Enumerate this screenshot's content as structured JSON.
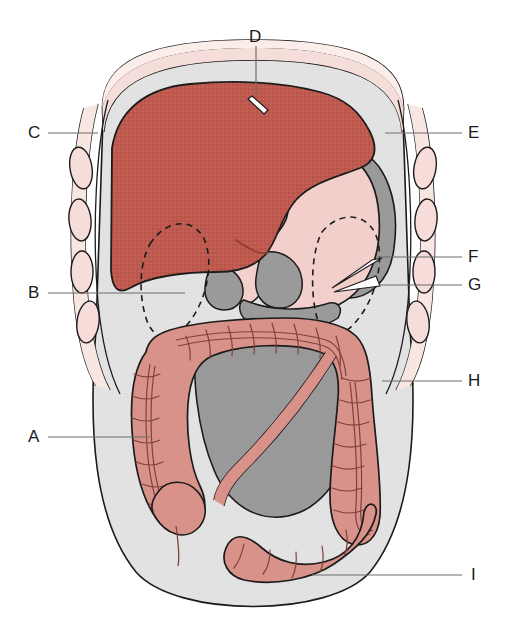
{
  "figure": {
    "view": "anterior abdominal cavity with labeled leader lines",
    "background_color": "#ffffff"
  },
  "colors": {
    "liver": "#C0594D",
    "liver_shade": "#A94A40",
    "stomach": "#F3D0CB",
    "colon": "#D99289",
    "colon_shade": "#C97F76",
    "dark_gray_organ": "#9A9A9A",
    "body_cavity": "#E3E3E3",
    "rib_fill": "#F7DDD9",
    "rib_band": "#F6E3DE",
    "outline": "#1b1b1b",
    "leader_line": "#6d6d6d",
    "label_text": "#1a1a1a"
  },
  "labels": [
    {
      "id": "A",
      "text": "A",
      "x": 33,
      "y": 437,
      "side": "left",
      "line_from_x": 48,
      "line_to_x": 150,
      "line_y": 437
    },
    {
      "id": "B",
      "text": "B",
      "x": 33,
      "y": 293,
      "side": "left",
      "line_from_x": 48,
      "line_to_x": 185,
      "line_y": 293
    },
    {
      "id": "C",
      "text": "C",
      "x": 33,
      "y": 133,
      "side": "left",
      "line_from_x": 48,
      "line_to_x": 98,
      "line_y": 133
    },
    {
      "id": "D",
      "text": "D",
      "x": 249,
      "y": 38,
      "side": "top",
      "line_from_y": 46,
      "line_to_y": 96,
      "line_x": 256
    },
    {
      "id": "E",
      "text": "E",
      "x": 468,
      "y": 133,
      "side": "right",
      "line_from_x": 385,
      "line_to_x": 462,
      "line_y": 133
    },
    {
      "id": "F",
      "text": "F",
      "x": 468,
      "y": 253,
      "side": "right",
      "line_from_x": 378,
      "line_to_x": 462,
      "line_y": 257
    },
    {
      "id": "G",
      "text": "G",
      "x": 468,
      "y": 281,
      "side": "right",
      "line_from_x": 378,
      "line_to_x": 462,
      "line_y": 285
    },
    {
      "id": "H",
      "text": "H",
      "x": 468,
      "y": 375,
      "side": "right",
      "line_from_x": 382,
      "line_to_x": 462,
      "line_y": 381
    },
    {
      "id": "I",
      "text": "I",
      "x": 470,
      "y": 569,
      "side": "right",
      "line_from_x": 312,
      "line_to_x": 462,
      "line_y": 575
    }
  ],
  "organs": [
    {
      "name": "liver",
      "color_key": "liver",
      "description": "large brick-red organ occupying upper-left of cavity"
    },
    {
      "name": "stomach",
      "color_key": "stomach",
      "description": "pale pink J-shaped organ right of liver"
    },
    {
      "name": "spleen",
      "color_key": "dark_gray_organ",
      "description": "dark gray crescent at upper right"
    },
    {
      "name": "large-intestine",
      "color_key": "colon",
      "description": "dusty rose haustrated colon framing lower cavity"
    },
    {
      "name": "small-intestine",
      "color_key": "dark_gray_organ",
      "description": "dark gray coiled mass in central lower cavity"
    },
    {
      "name": "kidney-left",
      "color_key": "outline",
      "description": "dashed bean outline, left upper quadrant"
    },
    {
      "name": "kidney-right",
      "color_key": "outline",
      "description": "dashed bean outline, right upper quadrant"
    },
    {
      "name": "rib-cage",
      "color_key": "rib_fill",
      "description": "pale pink oval ribs flanking both sides"
    },
    {
      "name": "body-wall",
      "color_key": "body_cavity",
      "description": "light gray abdominal silhouette"
    }
  ],
  "caption": {
    "text": ""
  }
}
